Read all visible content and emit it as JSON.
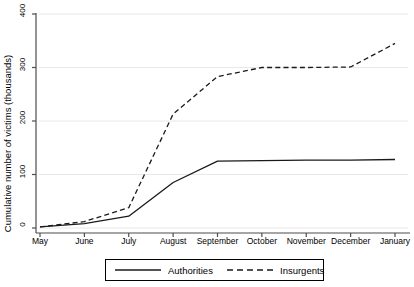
{
  "chart_data": {
    "type": "line",
    "title": "",
    "subtitle": "",
    "xlabel": "",
    "ylabel": "Cumulative number of victims (thousands)",
    "categories": [
      "May",
      "June",
      "July",
      "August",
      "September",
      "October",
      "November",
      "December",
      "January"
    ],
    "x_tick_labels": [
      "May",
      "June",
      "July",
      "August",
      "September",
      "October",
      "November",
      "December",
      "January"
    ],
    "y_tick_labels": [
      "0",
      "100",
      "200",
      "300",
      "400"
    ],
    "y_ticks": [
      0,
      100,
      200,
      300,
      400
    ],
    "ylim": [
      0,
      400
    ],
    "xlim": [
      "May",
      "January"
    ],
    "grid": "horizontal",
    "legend_position": "bottom-center",
    "series": [
      {
        "name": "Authorities",
        "style": "solid",
        "color": "#1a1a1a",
        "values": [
          2,
          8,
          22,
          85,
          125,
          126,
          127,
          127,
          128
        ]
      },
      {
        "name": "Insurgents",
        "style": "dashed",
        "color": "#1a1a1a",
        "values": [
          2,
          12,
          38,
          213,
          283,
          300,
          300,
          301,
          345
        ]
      }
    ],
    "series_points": {
      "Authorities": [
        {
          "x": "May",
          "y": 2
        },
        {
          "x": "June",
          "y": 8
        },
        {
          "x": "July",
          "y": 22
        },
        {
          "x": "August",
          "y": 85
        },
        {
          "x": "September",
          "y": 125
        },
        {
          "x": "October",
          "y": 126
        },
        {
          "x": "November",
          "y": 127
        },
        {
          "x": "December",
          "y": 127
        },
        {
          "x": "January",
          "y": 128
        }
      ],
      "Insurgents": [
        {
          "x": "May",
          "y": 2
        },
        {
          "x": "June",
          "y": 12
        },
        {
          "x": "July",
          "y": 38
        },
        {
          "x": "August",
          "y": 213
        },
        {
          "x": "September",
          "y": 283
        },
        {
          "x": "October",
          "y": 300
        },
        {
          "x": "November",
          "y": 300
        },
        {
          "x": "December",
          "y": 301
        },
        {
          "x": "January",
          "y": 345
        }
      ]
    }
  },
  "legend": {
    "items": [
      {
        "label": "Authorities",
        "style": "solid"
      },
      {
        "label": "Insurgents",
        "style": "dashed"
      }
    ]
  },
  "axes": {
    "y_label": "Cumulative number of victims (thousands)"
  },
  "colors": {
    "line": "#1a1a1a",
    "grid": "#e8e8e8",
    "axis": "#4d4d4d",
    "background": "#ffffff",
    "text": "#000000"
  }
}
